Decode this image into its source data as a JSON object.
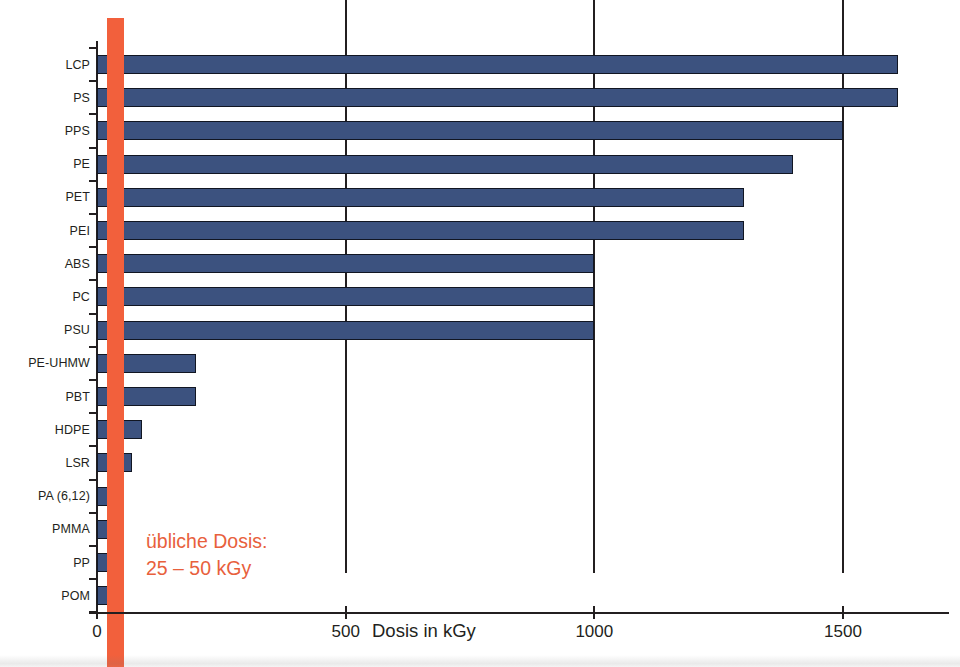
{
  "chart_data": {
    "type": "bar",
    "orientation": "horizontal",
    "title": "",
    "xlabel": "Dosis in kGy",
    "ylabel": "",
    "xlim": [
      0,
      1700
    ],
    "xticks": [
      0,
      500,
      1000,
      1500
    ],
    "xticklabels": [
      "0",
      "500",
      "1000",
      "1500"
    ],
    "grid": "vertical",
    "legend": "none",
    "bar_color": "#3c527f",
    "bar_edge_color": "#111622",
    "categories": [
      "LCP",
      "PS",
      "PPS",
      "PE",
      "PET",
      "PEI",
      "ABS",
      "PC",
      "PSU",
      "PE-UHMW",
      "PBT",
      "HDPE",
      "LSR",
      "PA (6,12)",
      "PMMA",
      "PP",
      "POM"
    ],
    "values": [
      1610,
      1610,
      1500,
      1400,
      1300,
      1300,
      1000,
      1000,
      1000,
      200,
      200,
      90,
      70,
      50,
      40,
      25,
      30
    ],
    "annotations": [
      {
        "name": "dose-band",
        "type": "vertical-band",
        "range": [
          25,
          50
        ],
        "color": "#f2603c",
        "label_line1": "übliche Dosis:",
        "label_line2": "25 – 50 kGy",
        "label_color": "#e8603c"
      }
    ]
  },
  "axis": {
    "title": "Dosis in kGy",
    "tick_labels": [
      "0",
      "500",
      "1000",
      "1500"
    ]
  },
  "annotation": {
    "line1": "übliche Dosis:",
    "line2": "25 – 50 kGy"
  },
  "colors": {
    "bar": "#3c527f",
    "bar_edge": "#111622",
    "accent_orange": "#f2603c",
    "text": "#231f20",
    "background": "#ffffff"
  }
}
